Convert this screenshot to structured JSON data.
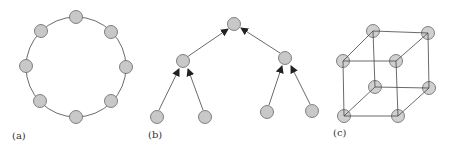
{
  "colors": {
    "edge": "#444444",
    "node_fill": "#c8c8c8",
    "node_stroke": "#555555"
  },
  "panels": [
    {
      "id": "a",
      "label": "(a)",
      "type": "ring",
      "nodes": 8
    },
    {
      "id": "b",
      "label": "(b)",
      "type": "binary-tree",
      "nodes": 7,
      "edges_directed": "child-to-parent"
    },
    {
      "id": "c",
      "label": "(c)",
      "type": "cube",
      "nodes": 8
    }
  ]
}
